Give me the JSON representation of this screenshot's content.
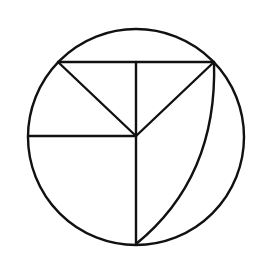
{
  "diagram": {
    "type": "geometry-figure",
    "stroke_color": "#111111",
    "background_color": "#ffffff",
    "stroke_width": 2.4,
    "circle": {
      "cx": 136,
      "cy": 137,
      "r": 108
    },
    "points": {
      "center": [
        136,
        136
      ],
      "top_left": [
        58,
        62
      ],
      "top_right": [
        214,
        62
      ],
      "top_mid": [
        136,
        62
      ],
      "left": [
        28,
        136
      ],
      "bottom": [
        136,
        244
      ]
    },
    "segments": [
      {
        "name": "chord-top",
        "from": "top_left",
        "to": "top_right"
      },
      {
        "name": "top-left-to-center",
        "from": "top_left",
        "to": "center"
      },
      {
        "name": "top-right-to-center",
        "from": "top_right",
        "to": "center"
      },
      {
        "name": "vertical-top",
        "from": "top_mid",
        "to": "center"
      },
      {
        "name": "radius-left",
        "from": "left",
        "to": "center"
      },
      {
        "name": "radius-bottom",
        "from": "center",
        "to": "bottom"
      }
    ],
    "arc": {
      "name": "curved-arc",
      "path": "M214,62 C216,125 200,192 136,244"
    }
  }
}
